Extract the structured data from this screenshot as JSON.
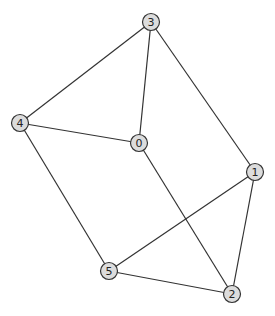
{
  "graph": {
    "type": "undirected",
    "nodes": [
      {
        "id": "0",
        "label": "0"
      },
      {
        "id": "1",
        "label": "1"
      },
      {
        "id": "2",
        "label": "2"
      },
      {
        "id": "3",
        "label": "3"
      },
      {
        "id": "4",
        "label": "4"
      },
      {
        "id": "5",
        "label": "5"
      }
    ],
    "edges": [
      [
        "3",
        "4"
      ],
      [
        "3",
        "0"
      ],
      [
        "3",
        "1"
      ],
      [
        "4",
        "0"
      ],
      [
        "4",
        "5"
      ],
      [
        "0",
        "2"
      ],
      [
        "1",
        "5"
      ],
      [
        "1",
        "2"
      ],
      [
        "5",
        "2"
      ]
    ],
    "colors": {
      "node_fill": "#dcdcdc",
      "node_stroke": "#333333",
      "edge": "#333333"
    }
  }
}
